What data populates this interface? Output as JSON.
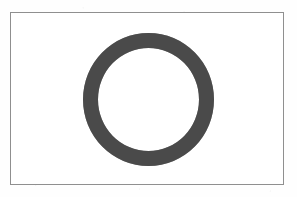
{
  "figure": {
    "title": "",
    "caption": "",
    "shape_name": "ring",
    "shape_description": "thick dark annulus centered inside a thin rectangular frame",
    "background_color": "#fefefe",
    "canvas": {
      "width": 297,
      "height": 197
    },
    "frame": {
      "name": "rectangular border",
      "stroke_color": "#8f8f8f",
      "fill_color": "#ffffff",
      "stroke_width": 1,
      "left": 10,
      "top": 12,
      "width": 274,
      "height": 173
    },
    "ring": {
      "name": "annulus",
      "fill_color": "#4a4a4a",
      "inner_fill_color": "#ffffff",
      "center_x": 148,
      "center_y": 99,
      "outer_width": 131,
      "outer_height": 133,
      "band_thickness": 15,
      "inner_diameter": 101
    }
  }
}
